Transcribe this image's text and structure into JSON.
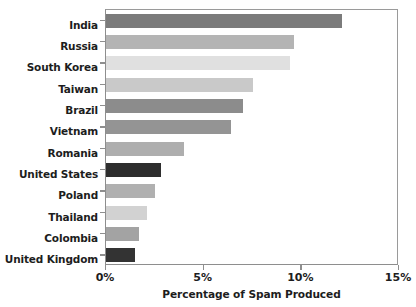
{
  "chart_data": {
    "type": "bar",
    "orientation": "horizontal",
    "title": "",
    "subtitle": "",
    "xlabel": "Percentage of Spam Produced",
    "ylabel": "",
    "xlim": [
      0,
      15
    ],
    "xtick_labels": [
      "0%",
      "5%",
      "10%",
      "15%"
    ],
    "xticks": [
      0,
      5,
      10,
      15
    ],
    "grid": false,
    "legend": "none",
    "categories": [
      "India",
      "Russia",
      "South Korea",
      "Taiwan",
      "Brazil",
      "Vietnam",
      "Romania",
      "United States",
      "Poland",
      "Thailand",
      "Colombia",
      "United Kingdom"
    ],
    "values": [
      12.1,
      9.6,
      9.4,
      7.5,
      7.0,
      6.4,
      4.0,
      2.8,
      2.5,
      2.1,
      1.7,
      1.5
    ],
    "bar_colors": [
      "#7b7b7b",
      "#b4b4b4",
      "#e0e0e0",
      "#c9c9c9",
      "#8c8c8c",
      "#949494",
      "#aeaeae",
      "#2e2e2e",
      "#b0b0b0",
      "#d2d2d2",
      "#a3a3a3",
      "#333333"
    ],
    "bars": [
      {
        "label": "India",
        "value": 12.1,
        "color": "#7b7b7b"
      },
      {
        "label": "Russia",
        "value": 9.6,
        "color": "#b4b4b4"
      },
      {
        "label": "South Korea",
        "value": 9.4,
        "color": "#e0e0e0"
      },
      {
        "label": "Taiwan",
        "value": 7.5,
        "color": "#c9c9c9"
      },
      {
        "label": "Brazil",
        "value": 7.0,
        "color": "#8c8c8c"
      },
      {
        "label": "Vietnam",
        "value": 6.4,
        "color": "#949494"
      },
      {
        "label": "Romania",
        "value": 4.0,
        "color": "#aeaeae"
      },
      {
        "label": "United States",
        "value": 2.8,
        "color": "#2e2e2e"
      },
      {
        "label": "Poland",
        "value": 2.5,
        "color": "#b0b0b0"
      },
      {
        "label": "Thailand",
        "value": 2.1,
        "color": "#d2d2d2"
      },
      {
        "label": "Colombia",
        "value": 1.7,
        "color": "#a3a3a3"
      },
      {
        "label": "United Kingdom",
        "value": 1.5,
        "color": "#333333"
      }
    ],
    "axis_color": "#8e8e8e",
    "background": "#ffffff"
  }
}
